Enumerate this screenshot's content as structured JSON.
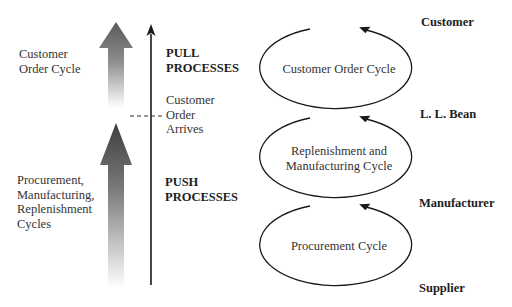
{
  "left_labels": {
    "customer_order_cycle": [
      "Customer",
      "Order Cycle"
    ],
    "push_cycles": [
      "Procurement,",
      "Manufacturing,",
      "Replenishment",
      "Cycles"
    ]
  },
  "axis_labels": {
    "pull": [
      "PULL",
      "PROCESSES"
    ],
    "push": [
      "PUSH",
      "PROCESSES"
    ],
    "boundary": [
      "Customer",
      "Order",
      "Arrives"
    ]
  },
  "cycles": [
    {
      "lines": [
        "Customer Order Cycle"
      ]
    },
    {
      "lines": [
        "Replenishment and",
        "Manufacturing Cycle"
      ]
    },
    {
      "lines": [
        "Procurement Cycle"
      ]
    }
  ],
  "stages": [
    "Customer",
    "L. L. Bean",
    "Manufacturer",
    "Supplier"
  ],
  "colors": {
    "line": "#1a1a1a",
    "arrow_dark": "#4a4a4a",
    "arrow_light": "#ffffff"
  }
}
